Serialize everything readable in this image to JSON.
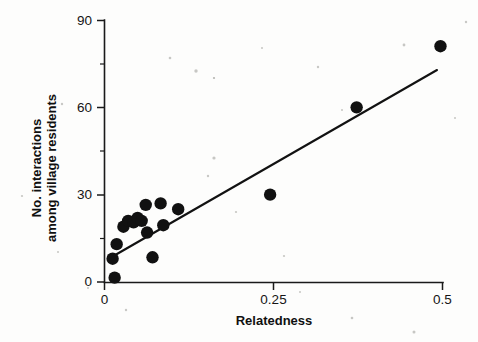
{
  "chart_data": {
    "type": "scatter",
    "title": "",
    "xlabel": "Relatedness",
    "ylabel": "No. interactions among village residents",
    "ylabel_line1": "No. interactions",
    "ylabel_line2": "among village residents",
    "xlim": [
      0,
      0.5
    ],
    "ylim": [
      0,
      90
    ],
    "xticks": [
      0,
      0.25,
      0.5
    ],
    "xtick_labels": [
      "0",
      "0.25",
      "0.5"
    ],
    "yticks": [
      0,
      30,
      60,
      90
    ],
    "ytick_labels": [
      "0",
      "30",
      "60",
      "90"
    ],
    "y_minor_ticks": [
      15,
      45,
      75
    ],
    "grid": false,
    "legend": false,
    "marker": "filled-circle",
    "marker_color": "#111111",
    "points": [
      {
        "x": 0.012,
        "y": 8
      },
      {
        "x": 0.015,
        "y": 1.5
      },
      {
        "x": 0.018,
        "y": 13
      },
      {
        "x": 0.028,
        "y": 19
      },
      {
        "x": 0.035,
        "y": 21
      },
      {
        "x": 0.043,
        "y": 20.5
      },
      {
        "x": 0.049,
        "y": 22
      },
      {
        "x": 0.055,
        "y": 21
      },
      {
        "x": 0.061,
        "y": 26.5
      },
      {
        "x": 0.063,
        "y": 17
      },
      {
        "x": 0.071,
        "y": 8.5
      },
      {
        "x": 0.083,
        "y": 27
      },
      {
        "x": 0.087,
        "y": 19.5
      },
      {
        "x": 0.109,
        "y": 25
      },
      {
        "x": 0.245,
        "y": 30
      },
      {
        "x": 0.373,
        "y": 60
      },
      {
        "x": 0.497,
        "y": 81
      }
    ],
    "trend_line": {
      "type": "linear-fit",
      "x_start": 0.009,
      "y_start": 8.2,
      "x_end": 0.491,
      "y_end": 73.0,
      "color": "#121212"
    }
  }
}
